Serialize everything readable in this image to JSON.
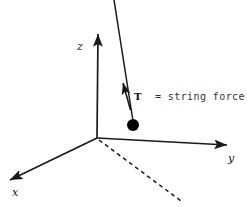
{
  "figure": {
    "background_color": "#ffffff",
    "stroke_color": "#1a1a1a",
    "bob_color": "#000000",
    "legend_color": "#333333",
    "width": 247,
    "height": 207
  },
  "axes": {
    "z": {
      "label": "z",
      "origin": [
        97,
        138
      ],
      "tip": [
        98,
        30
      ]
    },
    "y": {
      "label": "y",
      "origin": [
        97,
        138
      ],
      "tip": [
        232,
        146
      ]
    },
    "x": {
      "label": "x",
      "origin": [
        97,
        138
      ],
      "tip": [
        5,
        182
      ]
    }
  },
  "projection_line": {
    "name": "dashed-projection",
    "style": "dashed",
    "start": [
      99,
      140
    ],
    "end": [
      181,
      201
    ]
  },
  "pendulum": {
    "string": {
      "start": [
        114,
        0
      ],
      "end": [
        133,
        121
      ]
    },
    "bob": {
      "center": [
        133,
        125
      ],
      "radius": 5.5
    },
    "tension_vector": {
      "label": "T",
      "tail": [
        130,
        108
      ],
      "head": [
        122,
        79
      ],
      "label_position": [
        136,
        98
      ]
    }
  },
  "legend": {
    "equals_sign": "=",
    "text": "= string force",
    "position": [
      155,
      96
    ]
  }
}
